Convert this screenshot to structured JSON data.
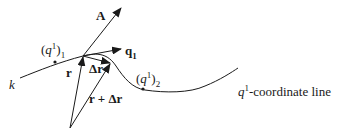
{
  "diagram": {
    "labels": {
      "vector_A": "A",
      "vector_q1_base": "q",
      "vector_q1_sub": "1",
      "point1_open": "(",
      "point1_q": "q",
      "point1_sup": "1",
      "point1_close": ")",
      "point1_sub": "1",
      "point2_open": "(",
      "point2_q": "q",
      "point2_sup": "1",
      "point2_close": ")",
      "point2_sub": "2",
      "curve_k": "k",
      "vector_r": "r",
      "vector_delta_r": "Δr",
      "vector_r_plus_delta_r": "r + Δr",
      "coordinate_line_q": "q",
      "coordinate_line_sup": "1",
      "coordinate_line_text": "-coordinate line"
    },
    "colors": {
      "stroke": "#1a1a1a",
      "background": "#ffffff"
    }
  }
}
